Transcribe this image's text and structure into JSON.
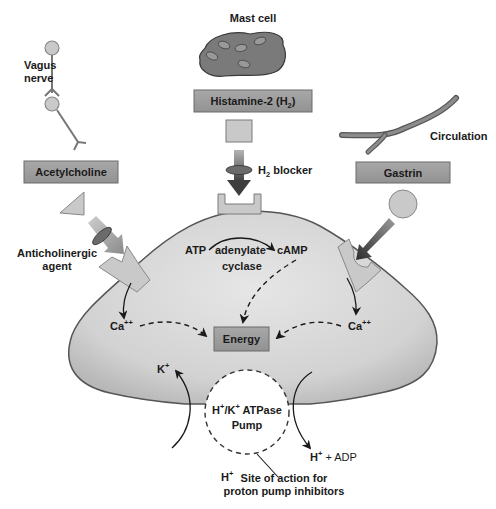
{
  "colors": {
    "cell_fill": "#d9d9d9",
    "cell_stroke": "#555555",
    "label_box_fill": "#9e9e9e",
    "receptor_fill": "#c9c9c9",
    "mast_cell_fill": "#7a7a7a",
    "arrow_dark": "#4a4a4a",
    "text": "#1a1a1a"
  },
  "labels": {
    "mast_cell": "Mast cell",
    "histamine": "Histamine-2 (H",
    "histamine_sub": "2",
    "histamine_close": ")",
    "h2_blocker_h": "H",
    "h2_blocker_sub": "2",
    "h2_blocker_rest": " blocker",
    "vagus_line1": "Vagus",
    "vagus_line2": "nerve",
    "acetylcholine": "Acetylcholine",
    "anticholinergic_line1": "Anticholinergic",
    "anticholinergic_line2": "agent",
    "circulation": "Circulation",
    "gastrin": "Gastrin",
    "atp": "ATP",
    "adenylate": "adenylate",
    "cyclase": "cyclase",
    "camp": "cAMP",
    "ca_left": "Ca",
    "ca_left_sup": "++",
    "ca_right": "Ca",
    "ca_right_sup": "++",
    "energy": "Energy",
    "k_plus": "K",
    "k_plus_sup": "+",
    "pump_line1_h": "H",
    "pump_line1_hsup": "+",
    "pump_line1_k": "/K",
    "pump_line1_ksup": "+",
    "pump_line1_rest": " ATPase",
    "pump_line2": "Pump",
    "h_adp_h": "H",
    "h_adp_sup": "+",
    "h_adp_rest": " + ADP",
    "h_plus": "H",
    "h_plus_sup": "+",
    "site_line1": "Site of action for",
    "site_line2": "proton pump inhibitors"
  }
}
